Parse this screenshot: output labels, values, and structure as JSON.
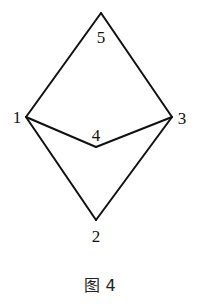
{
  "figure": {
    "caption": "图 4",
    "nodes": [
      {
        "id": "1",
        "label": "1",
        "x": 26,
        "y": 117,
        "lx": 17,
        "ly": 123
      },
      {
        "id": "2",
        "label": "2",
        "x": 96,
        "y": 220,
        "lx": 96,
        "ly": 242
      },
      {
        "id": "3",
        "label": "3",
        "x": 172,
        "y": 117,
        "lx": 182,
        "ly": 124
      },
      {
        "id": "4",
        "label": "4",
        "x": 96,
        "y": 147,
        "lx": 96,
        "ly": 141
      },
      {
        "id": "5",
        "label": "5",
        "x": 101,
        "y": 13,
        "lx": 101,
        "ly": 43
      }
    ],
    "edges": [
      [
        "1",
        "5"
      ],
      [
        "5",
        "3"
      ],
      [
        "1",
        "4"
      ],
      [
        "4",
        "3"
      ],
      [
        "1",
        "2"
      ],
      [
        "2",
        "3"
      ]
    ]
  }
}
